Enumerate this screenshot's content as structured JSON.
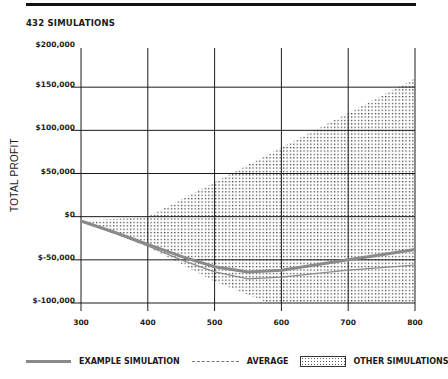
{
  "header": {
    "title": "432 SIMULATIONS"
  },
  "chart_data": {
    "type": "area",
    "title": "432 SIMULATIONS",
    "xlabel": "",
    "ylabel": "TOTAL PROFIT",
    "x_ticks": [
      "300",
      "400",
      "500",
      "600",
      "700",
      "800"
    ],
    "y_ticks": [
      "$200,000",
      "$150,000",
      "$100,000",
      "$50,000",
      "$0",
      "$-50,000",
      "$-100,000"
    ],
    "xlim": [
      300,
      800
    ],
    "ylim": [
      -100000,
      200000
    ],
    "grid": true,
    "legend_position": "bottom",
    "legend": [
      "EXAMPLE SIMULATION",
      "AVERAGE",
      "OTHER SIMULATIONS"
    ],
    "series": [
      {
        "name": "EXAMPLE SIMULATION",
        "style": "solid thick gray",
        "x": [
          300,
          350,
          400,
          450,
          500,
          550,
          600,
          650,
          700,
          750,
          800
        ],
        "values": [
          -5000,
          -18000,
          -32000,
          -46000,
          -58000,
          -64000,
          -62000,
          -56000,
          -50000,
          -44000,
          -38000
        ]
      },
      {
        "name": "AVERAGE",
        "style": "dashed thin gray",
        "x": [
          300,
          350,
          400,
          450,
          500,
          550,
          600,
          650,
          700,
          750,
          800
        ],
        "values": [
          -5000,
          -19000,
          -34000,
          -50000,
          -64000,
          -72000,
          -70000,
          -66000,
          -62000,
          -59000,
          -56000
        ]
      },
      {
        "name": "OTHER SIMULATIONS",
        "style": "dotted band",
        "x": [
          300,
          400,
          500,
          580,
          600,
          700,
          800
        ],
        "upper": [
          -5000,
          0,
          40000,
          72000,
          80000,
          120000,
          160000
        ],
        "lower": [
          -5000,
          -35000,
          -75000,
          -100000,
          -100000,
          -100000,
          -100000
        ]
      }
    ]
  },
  "legend": {
    "example": "EXAMPLE SIMULATION",
    "average": "AVERAGE",
    "other": "OTHER SIMULATIONS"
  },
  "colors": {
    "grid": "#1a1a1a",
    "example_line": "#8a8a8a",
    "average_line": "#8a8a8a",
    "band_dots": "#444444"
  }
}
